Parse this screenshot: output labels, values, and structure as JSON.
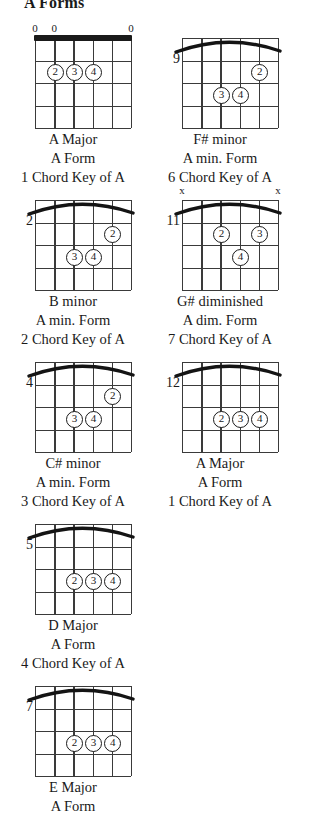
{
  "page": {
    "title": "A Forms"
  },
  "diagram_defaults": {
    "strings": 6,
    "frets": 4,
    "finger_glyphs": [
      "1",
      "2",
      "3",
      "4"
    ]
  },
  "chords": [
    {
      "name": "A Major",
      "form": "A Form",
      "degree": "1 Chord Key of A",
      "position_label": "",
      "nut": true,
      "barre": false,
      "top_marks": [
        {
          "string": 1,
          "symbol": "0"
        },
        {
          "string": 2,
          "symbol": "0"
        },
        {
          "string": 6,
          "symbol": "0"
        }
      ],
      "fingers": [
        {
          "finger": "2",
          "string": 2,
          "fret": 2
        },
        {
          "finger": "3",
          "string": 3,
          "fret": 2
        },
        {
          "finger": "4",
          "string": 4,
          "fret": 2
        }
      ]
    },
    {
      "name": "F# minor",
      "form": "A min. Form",
      "degree": "6 Chord Key of A",
      "position_label": "9",
      "nut": false,
      "barre": true,
      "top_marks": [],
      "fingers": [
        {
          "finger": "2",
          "string": 5,
          "fret": 2
        },
        {
          "finger": "3",
          "string": 3,
          "fret": 3
        },
        {
          "finger": "4",
          "string": 4,
          "fret": 3
        }
      ]
    },
    {
      "name": "B minor",
      "form": "A min. Form",
      "degree": "2 Chord Key of A",
      "position_label": "2",
      "nut": false,
      "barre": true,
      "top_marks": [],
      "fingers": [
        {
          "finger": "2",
          "string": 5,
          "fret": 2
        },
        {
          "finger": "3",
          "string": 3,
          "fret": 3
        },
        {
          "finger": "4",
          "string": 4,
          "fret": 3
        }
      ]
    },
    {
      "name": "G# diminished",
      "form": "A dim. Form",
      "degree": "7 Chord Key of A",
      "position_label": "11",
      "nut": false,
      "barre": true,
      "top_marks": [
        {
          "string": 1,
          "symbol": "x"
        },
        {
          "string": 6,
          "symbol": "x"
        }
      ],
      "fingers": [
        {
          "finger": "2",
          "string": 3,
          "fret": 2
        },
        {
          "finger": "3",
          "string": 5,
          "fret": 2
        },
        {
          "finger": "4",
          "string": 4,
          "fret": 3
        }
      ]
    },
    {
      "name": "C# minor",
      "form": "A min. Form",
      "degree": "3 Chord Key of A",
      "position_label": "4",
      "nut": false,
      "barre": true,
      "top_marks": [],
      "fingers": [
        {
          "finger": "2",
          "string": 5,
          "fret": 2
        },
        {
          "finger": "3",
          "string": 3,
          "fret": 3
        },
        {
          "finger": "4",
          "string": 4,
          "fret": 3
        }
      ]
    },
    {
      "name": "A Major",
      "form": "A Form",
      "degree": "1 Chord Key of A",
      "position_label": "12",
      "nut": false,
      "barre": true,
      "top_marks": [],
      "fingers": [
        {
          "finger": "2",
          "string": 3,
          "fret": 3
        },
        {
          "finger": "3",
          "string": 4,
          "fret": 3
        },
        {
          "finger": "4",
          "string": 5,
          "fret": 3
        }
      ]
    },
    {
      "name": "D Major",
      "form": "A Form",
      "degree": "4 Chord Key of A",
      "position_label": "5",
      "nut": false,
      "barre": true,
      "top_marks": [],
      "fingers": [
        {
          "finger": "2",
          "string": 3,
          "fret": 3
        },
        {
          "finger": "3",
          "string": 4,
          "fret": 3
        },
        {
          "finger": "4",
          "string": 5,
          "fret": 3
        }
      ]
    },
    {
      "name": "E Major",
      "form": "A Form",
      "degree": "",
      "position_label": "7",
      "nut": false,
      "barre": true,
      "top_marks": [],
      "fingers": [
        {
          "finger": "2",
          "string": 3,
          "fret": 3
        },
        {
          "finger": "3",
          "string": 4,
          "fret": 3
        },
        {
          "finger": "4",
          "string": 5,
          "fret": 3
        }
      ]
    }
  ],
  "layout": {
    "columns": 2,
    "cell_positions": [
      {
        "left": 25,
        "top": 24
      },
      {
        "left": 172,
        "top": 24
      },
      {
        "left": 25,
        "top": 186
      },
      {
        "left": 172,
        "top": 186
      },
      {
        "left": 25,
        "top": 348
      },
      {
        "left": 172,
        "top": 348
      },
      {
        "left": 25,
        "top": 510
      },
      {
        "left": 25,
        "top": 672
      }
    ]
  }
}
